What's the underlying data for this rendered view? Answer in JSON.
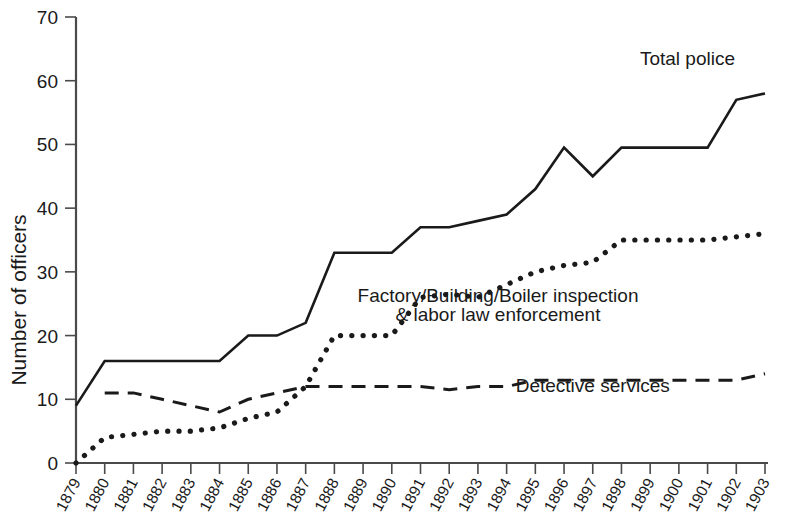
{
  "chart_data": {
    "type": "line",
    "title": "",
    "subtitle": "",
    "xlabel": "",
    "ylabel": "Number of officers",
    "xlim": [
      1879,
      1903
    ],
    "ylim": [
      0,
      70
    ],
    "yticks": [
      0,
      10,
      20,
      30,
      40,
      50,
      60,
      70
    ],
    "grid": false,
    "legend_position": "inline-annotations",
    "x": [
      1879,
      1880,
      1881,
      1882,
      1883,
      1884,
      1885,
      1886,
      1887,
      1888,
      1889,
      1890,
      1891,
      1892,
      1893,
      1894,
      1895,
      1896,
      1897,
      1898,
      1899,
      1900,
      1901,
      1902,
      1903
    ],
    "xtick_labels": [
      "1879",
      "1880",
      "1881",
      "1882",
      "1883",
      "1884",
      "1885",
      "1886",
      "1887",
      "1888",
      "1889",
      "1890",
      "1891",
      "1892",
      "1893",
      "1894",
      "1895",
      "1896",
      "1897",
      "1898",
      "1899",
      "1900",
      "1901",
      "1902",
      "1903"
    ],
    "series": [
      {
        "name": "Total police",
        "style": "solid",
        "values": [
          9,
          16,
          16,
          16,
          16,
          16,
          20,
          20,
          22,
          33,
          33,
          33,
          37,
          37,
          38,
          39,
          43,
          49.5,
          45,
          49.5,
          49.5,
          49.5,
          49.5,
          57,
          58
        ]
      },
      {
        "name": "Factory/Building/Boiler inspection & labor law enforcement",
        "style": "dotted",
        "values": [
          0,
          4,
          4.5,
          5,
          5,
          5.5,
          7,
          8,
          12,
          20,
          20,
          20,
          26,
          26.5,
          26,
          28,
          30,
          31,
          31.5,
          35,
          35,
          35,
          35,
          35.5,
          36
        ]
      },
      {
        "name": "Detective services",
        "style": "dashed",
        "values": [
          null,
          11,
          11,
          10,
          9,
          8,
          10,
          11,
          12,
          12,
          12,
          12,
          12,
          11.5,
          12,
          12,
          13,
          13,
          13,
          13,
          13,
          13,
          13,
          13,
          14
        ]
      }
    ],
    "annotations": [
      {
        "text": "Total police",
        "x": 1900.3,
        "y": 62.5
      },
      {
        "text": "Factory/Building/Boiler inspection",
        "x": 1893.7,
        "y": 25.3
      },
      {
        "text": "& labor law enforcement",
        "x": 1893.7,
        "y": 22.3
      },
      {
        "text": "Detective services",
        "x": 1897.0,
        "y": 11.2
      }
    ]
  },
  "axis": {
    "y_title": "Number of officers"
  }
}
